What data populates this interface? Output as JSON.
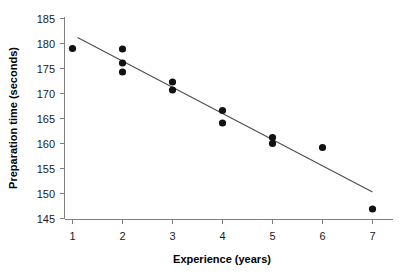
{
  "chart_data": {
    "type": "scatter",
    "title": "",
    "xlabel": "Experience (years)",
    "ylabel": "Preparation time (seconds)",
    "xlim": [
      0.6,
      7.5
    ],
    "ylim": [
      145,
      185
    ],
    "xticks": [
      1,
      2,
      3,
      4,
      5,
      6,
      7
    ],
    "xtick_labels": [
      "1",
      "2",
      "3",
      "4",
      "5",
      "6",
      "7"
    ],
    "yticks": [
      145,
      150,
      155,
      160,
      165,
      170,
      175,
      180,
      185
    ],
    "ytick_labels": [
      "145",
      "150",
      "155",
      "160",
      "165",
      "170",
      "175",
      "180",
      "185"
    ],
    "grid": false,
    "legend": "none",
    "series": [
      {
        "name": "Observations",
        "marker": "circle",
        "color": "#111111",
        "points": [
          {
            "x": 1,
            "y": 179.0
          },
          {
            "x": 2,
            "y": 178.9
          },
          {
            "x": 2,
            "y": 176.1
          },
          {
            "x": 2,
            "y": 174.3
          },
          {
            "x": 3,
            "y": 172.3
          },
          {
            "x": 3,
            "y": 170.7
          },
          {
            "x": 4,
            "y": 166.6
          },
          {
            "x": 4,
            "y": 164.1
          },
          {
            "x": 5,
            "y": 161.2
          },
          {
            "x": 5,
            "y": 160.0
          },
          {
            "x": 6,
            "y": 159.2
          },
          {
            "x": 7,
            "y": 146.9
          }
        ]
      },
      {
        "name": "Fitted regression line",
        "marker": "line",
        "color": "#4d4d4d",
        "points": [
          {
            "x": 1.1,
            "y": 181.2
          },
          {
            "x": 7.0,
            "y": 150.3
          }
        ]
      }
    ]
  }
}
